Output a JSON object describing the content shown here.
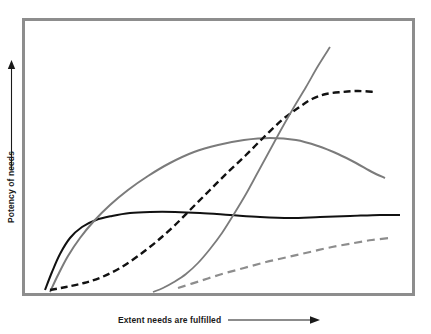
{
  "chart_data": {
    "type": "line",
    "title": "",
    "subtitle": "",
    "xlabel": "Extent needs are fulfilled",
    "ylabel": "Potency of needs",
    "xlabel_arrow": "arrow-right",
    "ylabel_arrow": "arrow-up",
    "xticks": [],
    "yticks": [],
    "xtick_labels": [],
    "ytick_labels": [],
    "grid": false,
    "legend": null,
    "legend_position": "none",
    "axis_style": "conceptual-unscaled",
    "xlim": [
      0,
      100
    ],
    "ylim": [
      0,
      100
    ],
    "frame_color": "#8d8d8d",
    "background_color": "#ffffff",
    "annotations": [],
    "series": [
      {
        "name": "black-solid-plateau",
        "color": "#111111",
        "style": "solid",
        "width": 2.0,
        "description": "Rises steeply from origin, plateaus early and stays flat",
        "points": [
          [
            45,
            290
          ],
          [
            52,
            272
          ],
          [
            60,
            254
          ],
          [
            70,
            238
          ],
          [
            82,
            227
          ],
          [
            96,
            220
          ],
          [
            112,
            216
          ],
          [
            130,
            213
          ],
          [
            150,
            212
          ],
          [
            175,
            212
          ],
          [
            200,
            213
          ],
          [
            230,
            215
          ],
          [
            260,
            217
          ],
          [
            290,
            218
          ],
          [
            320,
            217
          ],
          [
            350,
            216
          ],
          [
            380,
            215
          ],
          [
            400,
            215
          ]
        ]
      },
      {
        "name": "gray-solid-arch",
        "color": "#7b7b7b",
        "style": "solid",
        "width": 2.0,
        "description": "Broad inverted-U arch peaking mid-right then declining",
        "points": [
          [
            50,
            292
          ],
          [
            58,
            275
          ],
          [
            68,
            256
          ],
          [
            80,
            238
          ],
          [
            94,
            221
          ],
          [
            110,
            205
          ],
          [
            128,
            190
          ],
          [
            148,
            176
          ],
          [
            170,
            163
          ],
          [
            194,
            152
          ],
          [
            218,
            145
          ],
          [
            244,
            140
          ],
          [
            270,
            138
          ],
          [
            296,
            140
          ],
          [
            318,
            146
          ],
          [
            338,
            154
          ],
          [
            356,
            163
          ],
          [
            372,
            172
          ],
          [
            385,
            178
          ]
        ]
      },
      {
        "name": "black-dashed-sigmoid",
        "color": "#111111",
        "style": "dashed",
        "width": 2.4,
        "dash": [
          7,
          4
        ],
        "description": "Slow start, steep S-shaped rise, high plateau on right",
        "points": [
          [
            50,
            290
          ],
          [
            66,
            287
          ],
          [
            84,
            283
          ],
          [
            102,
            277
          ],
          [
            120,
            268
          ],
          [
            138,
            256
          ],
          [
            156,
            242
          ],
          [
            174,
            226
          ],
          [
            192,
            208
          ],
          [
            210,
            190
          ],
          [
            228,
            172
          ],
          [
            246,
            155
          ],
          [
            264,
            137
          ],
          [
            282,
            120
          ],
          [
            298,
            108
          ],
          [
            312,
            99
          ],
          [
            326,
            94
          ],
          [
            342,
            92
          ],
          [
            358,
            91
          ],
          [
            375,
            92
          ]
        ]
      },
      {
        "name": "gray-solid-steep",
        "color": "#7b7b7b",
        "style": "solid",
        "width": 1.8,
        "description": "Late onset, very steep near-vertical rise on right",
        "points": [
          [
            153,
            292
          ],
          [
            163,
            288
          ],
          [
            174,
            282
          ],
          [
            186,
            274
          ],
          [
            198,
            263
          ],
          [
            210,
            249
          ],
          [
            222,
            233
          ],
          [
            234,
            214
          ],
          [
            246,
            194
          ],
          [
            258,
            172
          ],
          [
            270,
            150
          ],
          [
            282,
            128
          ],
          [
            294,
            107
          ],
          [
            306,
            87
          ],
          [
            318,
            66
          ],
          [
            330,
            47
          ]
        ]
      },
      {
        "name": "gray-dashed-slow",
        "color": "#8d8d8d",
        "style": "dashed",
        "width": 2.2,
        "dash": [
          8,
          5
        ],
        "description": "Gentle near-linear slow rise along the bottom",
        "points": [
          [
            178,
            288
          ],
          [
            200,
            281
          ],
          [
            222,
            274
          ],
          [
            244,
            268
          ],
          [
            266,
            262
          ],
          [
            288,
            257
          ],
          [
            310,
            252
          ],
          [
            332,
            247
          ],
          [
            354,
            243
          ],
          [
            372,
            240
          ],
          [
            390,
            238
          ]
        ]
      }
    ]
  }
}
